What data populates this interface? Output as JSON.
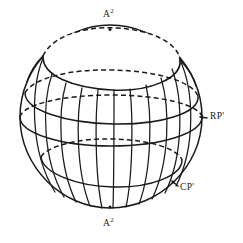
{
  "figure": {
    "kind": "sphere-diagram",
    "background_color": "#ffffff",
    "ink_color": "#1a1a1a",
    "labels": [
      {
        "id": "top-pole",
        "base": "A",
        "sup": "2",
        "x": 107,
        "y": 9,
        "anchor": "center"
      },
      {
        "id": "right-equator",
        "base": "RP'",
        "sup": "",
        "x": 209,
        "y": 114,
        "anchor": "left"
      },
      {
        "id": "bottom-right",
        "base": "CP'",
        "sup": "",
        "x": 179,
        "y": 186,
        "anchor": "left"
      },
      {
        "id": "bottom-pole",
        "base": "A",
        "sup": "2",
        "x": 107,
        "y": 221,
        "anchor": "center"
      }
    ],
    "label_text": {
      "top_pole": "A",
      "top_pole_sup": "2",
      "right_equator": "RP'",
      "bottom_right": "CP'",
      "bottom_pole": "A",
      "bottom_pole_sup": "2"
    },
    "geometry": {
      "sphere_center_x": 111,
      "sphere_center_y": 117,
      "sphere_radius_x": 92,
      "sphere_radius_y": 92,
      "meridian_count": 11,
      "latitude_count": 4,
      "cap_present": true
    },
    "markers": [
      {
        "id": "top-pole-tick",
        "x": 110,
        "y": 30
      },
      {
        "id": "right-equator-tick",
        "x": 203,
        "y": 118
      },
      {
        "id": "bottom-right-tick",
        "x": 175,
        "y": 184
      },
      {
        "id": "bottom-pole-tick",
        "x": 110,
        "y": 207
      }
    ]
  }
}
